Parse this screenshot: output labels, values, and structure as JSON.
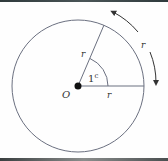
{
  "diagram": {
    "center_label": "O",
    "radius_label_angled": "r",
    "radius_label_horizontal": "r",
    "arc_label": "r",
    "angle_label_value": "1",
    "angle_label_unit": "c",
    "colors": {
      "stroke": "#6b7080",
      "text": "#333333",
      "dot": "#111111",
      "border": "#3a4244"
    }
  }
}
